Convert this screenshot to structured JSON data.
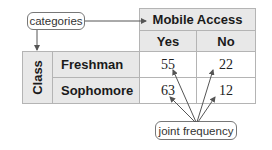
{
  "callouts": {
    "categories": "categories",
    "joint_frequency": "joint frequency"
  },
  "table": {
    "column_group_header": "Mobile Access",
    "row_group_header": "Class",
    "columns": [
      "Yes",
      "No"
    ],
    "rows": [
      {
        "label": "Freshman",
        "values": [
          "55",
          "22"
        ]
      },
      {
        "label": "Sophomore",
        "values": [
          "63",
          "12"
        ]
      }
    ]
  },
  "colors": {
    "header_bg": "#e8e8e8",
    "border": "#b4b4b4",
    "arrow": "#555555"
  }
}
